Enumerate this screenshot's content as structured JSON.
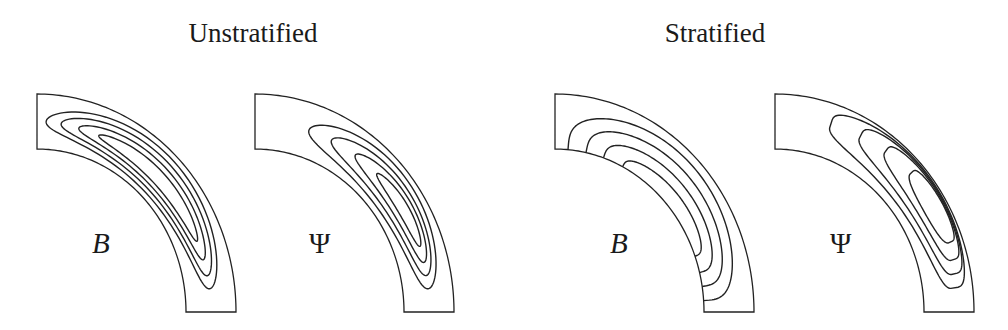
{
  "titles": [
    {
      "text": "Unstratified",
      "center_x": 253
    },
    {
      "text": "Stratified",
      "center_x": 715
    }
  ],
  "geometry": {
    "center_y": 312,
    "outer_rx": 199,
    "outer_ry": 218,
    "inner_rx": 149,
    "inner_ry": 163,
    "stroke_color": "#222222"
  },
  "panels": [
    {
      "id": "unstratified-B",
      "group": "Unstratified",
      "origin_x": 37,
      "label": "B",
      "label_italic": true,
      "label_x": 92,
      "label_y": 253,
      "contour_type": "closed",
      "contours": [
        {
          "t0": 87,
          "t1": 7,
          "r0": 0.1,
          "r1": 0.9
        },
        {
          "t0": 82,
          "t1": 11,
          "r0": 0.18,
          "r1": 0.8
        },
        {
          "t0": 76,
          "t1": 16,
          "r0": 0.26,
          "r1": 0.7
        },
        {
          "t0": 69,
          "t1": 22,
          "r0": 0.34,
          "r1": 0.6
        }
      ]
    },
    {
      "id": "unstratified-Psi",
      "group": "Unstratified",
      "origin_x": 255,
      "label": "Ψ",
      "label_italic": false,
      "label_x": 309,
      "label_y": 253,
      "contour_type": "closed",
      "contours": [
        {
          "t0": 72,
          "t1": 7,
          "r0": 0.12,
          "r1": 0.9
        },
        {
          "t0": 64,
          "t1": 11,
          "r0": 0.22,
          "r1": 0.8
        },
        {
          "t0": 55,
          "t1": 15,
          "r0": 0.32,
          "r1": 0.72
        },
        {
          "t0": 46,
          "t1": 20,
          "r0": 0.42,
          "r1": 0.64
        }
      ]
    },
    {
      "id": "stratified-B",
      "group": "Stratified",
      "origin_x": 555,
      "label": "B",
      "label_italic": true,
      "label_x": 610,
      "label_y": 253,
      "contour_type": "open-inner",
      "contours": [
        {
          "t0": 85,
          "t1": 4,
          "r0": 0.0,
          "r1": 0.85
        },
        {
          "t0": 78,
          "t1": 9,
          "r0": 0.0,
          "r1": 0.66
        },
        {
          "t0": 71,
          "t1": 14,
          "r0": 0.0,
          "r1": 0.47
        },
        {
          "t0": 63,
          "t1": 20,
          "r0": 0.0,
          "r1": 0.28
        }
      ]
    },
    {
      "id": "stratified-Psi",
      "group": "Stratified",
      "origin_x": 775,
      "label": "Ψ",
      "label_italic": false,
      "label_x": 830,
      "label_y": 253,
      "contour_type": "closed-outer",
      "contours": [
        {
          "t0": 72,
          "t1": 7,
          "r0": 0.16,
          "r1": 0.97
        },
        {
          "t0": 62,
          "t1": 11,
          "r0": 0.28,
          "r1": 0.95
        },
        {
          "t0": 53,
          "t1": 15,
          "r0": 0.4,
          "r1": 0.93
        },
        {
          "t0": 43,
          "t1": 20,
          "r0": 0.52,
          "r1": 0.91
        }
      ]
    }
  ]
}
